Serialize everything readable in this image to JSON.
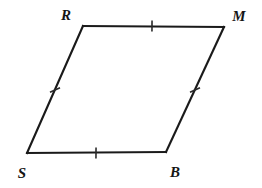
{
  "figure": {
    "kind": "geometry-diagram",
    "shape_name": "rhombus",
    "background_color": "#ffffff",
    "stroke_color": "#1a1a1a",
    "tick_color": "#2a2a2a",
    "label_color": "#151515",
    "canvas": {
      "width": 262,
      "height": 188
    },
    "vertices": [
      {
        "id": "R",
        "label": "R",
        "x": 83,
        "y": 26,
        "label_x": 66,
        "label_y": 20,
        "label_anchor": "middle"
      },
      {
        "id": "M",
        "label": "M",
        "x": 224,
        "y": 27,
        "label_x": 239,
        "label_y": 21,
        "label_anchor": "middle"
      },
      {
        "id": "B",
        "label": "B",
        "x": 166,
        "y": 152,
        "label_x": 175,
        "label_y": 177,
        "label_anchor": "middle"
      },
      {
        "id": "S",
        "label": "S",
        "x": 27,
        "y": 153,
        "label_x": 22,
        "label_y": 178,
        "label_anchor": "middle"
      }
    ],
    "edges": [
      {
        "id": "RM",
        "from": "R",
        "to": "M",
        "name": "top-edge",
        "tick_count": 1
      },
      {
        "id": "MB",
        "from": "M",
        "to": "B",
        "name": "right-edge",
        "tick_count": 1
      },
      {
        "id": "BS",
        "from": "B",
        "to": "S",
        "name": "bottom-edge",
        "tick_count": 1
      },
      {
        "id": "SR",
        "from": "S",
        "to": "R",
        "name": "left-edge",
        "tick_count": 1
      }
    ],
    "tick_marks": [
      {
        "edge": "RM",
        "cx": 152,
        "cy": 26,
        "angle_deg": 0.4,
        "length": 11
      },
      {
        "edge": "MB",
        "cx": 195,
        "cy": 90,
        "angle_deg": 65.1,
        "length": 11
      },
      {
        "edge": "BS",
        "cx": 96,
        "cy": 153,
        "angle_deg": 0.4,
        "length": 11
      },
      {
        "edge": "SR",
        "cx": 55,
        "cy": 90,
        "angle_deg": 66.0,
        "length": 11
      }
    ]
  }
}
